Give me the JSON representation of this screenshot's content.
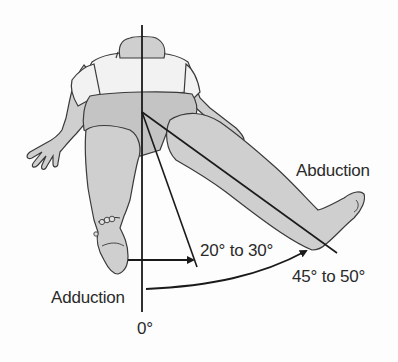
{
  "figure": {
    "labels": {
      "abduction": "Abduction",
      "adduction": "Adduction",
      "zero": "0°",
      "adduction_range": "20° to 30°",
      "abduction_range": "45° to 50°"
    },
    "colors": {
      "skin": "#cfcfcf",
      "clothing": "#f2f2f2",
      "shorts": "#bdbdbd",
      "outline": "#3a3a3a",
      "line": "#1a1a1a",
      "text": "#2a2a2a",
      "background": "#fdfdfd"
    },
    "angles": {
      "reference_deg": 0,
      "adduction_min_deg": 20,
      "adduction_max_deg": 30,
      "abduction_min_deg": 45,
      "abduction_max_deg": 50
    }
  }
}
